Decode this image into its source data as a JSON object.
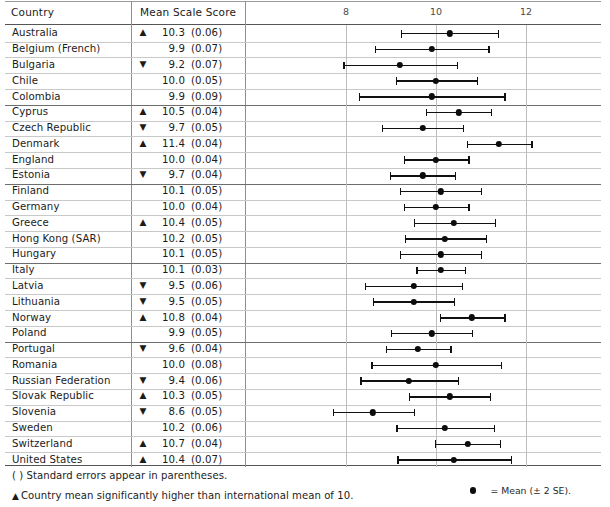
{
  "table": {
    "columns": {
      "country": "Country",
      "score": "Mean Scale Score"
    }
  },
  "footnotes": {
    "parentheses_note": "( ) Standard errors appear in parentheses.",
    "up_triangle_note": "Country mean significantly higher than international mean of 10.",
    "up_triangle_glyph": "▲"
  },
  "legend": {
    "dot_label": "= Mean (± 2 SE).",
    "dot_icon": "filled-circle"
  },
  "chart_data": {
    "type": "scatter",
    "title": "",
    "xlabel": "",
    "ylabel": "",
    "xlim": [
      6.9,
      13.3
    ],
    "ticks": [
      8,
      10,
      12
    ],
    "tick_labels": [
      "8",
      "10",
      "12"
    ],
    "grid": true,
    "error_bars": "mean plus/minus 2 SE",
    "reference_mean": 10,
    "markers": {
      "up": "▲",
      "down": "▼",
      "none": ""
    },
    "group_breaks": [
      5,
      10,
      15,
      20
    ],
    "rows": [
      {
        "country": "Australia",
        "mean": 10.3,
        "se": 0.06,
        "sig": "up",
        "mean_text": "10.3",
        "se_text": "(0.06)"
      },
      {
        "country": "Belgium (French)",
        "mean": 9.9,
        "se": 0.07,
        "sig": "none",
        "mean_text": "9.9",
        "se_text": "(0.07)"
      },
      {
        "country": "Bulgaria",
        "mean": 9.2,
        "se": 0.07,
        "sig": "down",
        "mean_text": "9.2",
        "se_text": "(0.07)"
      },
      {
        "country": "Chile",
        "mean": 10.0,
        "se": 0.05,
        "sig": "none",
        "mean_text": "10.0",
        "se_text": "(0.05)"
      },
      {
        "country": "Colombia",
        "mean": 9.9,
        "se": 0.09,
        "sig": "none",
        "mean_text": "9.9",
        "se_text": "(0.09)"
      },
      {
        "country": "Cyprus",
        "mean": 10.5,
        "se": 0.04,
        "sig": "up",
        "mean_text": "10.5",
        "se_text": "(0.04)"
      },
      {
        "country": "Czech Republic",
        "mean": 9.7,
        "se": 0.05,
        "sig": "down",
        "mean_text": "9.7",
        "se_text": "(0.05)"
      },
      {
        "country": "Denmark",
        "mean": 11.4,
        "se": 0.04,
        "sig": "up",
        "mean_text": "11.4",
        "se_text": "(0.04)"
      },
      {
        "country": "England",
        "mean": 10.0,
        "se": 0.04,
        "sig": "none",
        "mean_text": "10.0",
        "se_text": "(0.04)"
      },
      {
        "country": "Estonia",
        "mean": 9.7,
        "se": 0.04,
        "sig": "down",
        "mean_text": "9.7",
        "se_text": "(0.04)"
      },
      {
        "country": "Finland",
        "mean": 10.1,
        "se": 0.05,
        "sig": "none",
        "mean_text": "10.1",
        "se_text": "(0.05)"
      },
      {
        "country": "Germany",
        "mean": 10.0,
        "se": 0.04,
        "sig": "none",
        "mean_text": "10.0",
        "se_text": "(0.04)"
      },
      {
        "country": "Greece",
        "mean": 10.4,
        "se": 0.05,
        "sig": "up",
        "mean_text": "10.4",
        "se_text": "(0.05)"
      },
      {
        "country": "Hong Kong (SAR)",
        "mean": 10.2,
        "se": 0.05,
        "sig": "none",
        "mean_text": "10.2",
        "se_text": "(0.05)"
      },
      {
        "country": "Hungary",
        "mean": 10.1,
        "se": 0.05,
        "sig": "none",
        "mean_text": "10.1",
        "se_text": "(0.05)"
      },
      {
        "country": "Italy",
        "mean": 10.1,
        "se": 0.03,
        "sig": "none",
        "mean_text": "10.1",
        "se_text": "(0.03)"
      },
      {
        "country": "Latvia",
        "mean": 9.5,
        "se": 0.06,
        "sig": "down",
        "mean_text": "9.5",
        "se_text": "(0.06)"
      },
      {
        "country": "Lithuania",
        "mean": 9.5,
        "se": 0.05,
        "sig": "down",
        "mean_text": "9.5",
        "se_text": "(0.05)"
      },
      {
        "country": "Norway",
        "mean": 10.8,
        "se": 0.04,
        "sig": "up",
        "mean_text": "10.8",
        "se_text": "(0.04)"
      },
      {
        "country": "Poland",
        "mean": 9.9,
        "se": 0.05,
        "sig": "none",
        "mean_text": "9.9",
        "se_text": "(0.05)"
      },
      {
        "country": "Portugal",
        "mean": 9.6,
        "se": 0.04,
        "sig": "down",
        "mean_text": "9.6",
        "se_text": "(0.04)"
      },
      {
        "country": "Romania",
        "mean": 10.0,
        "se": 0.08,
        "sig": "none",
        "mean_text": "10.0",
        "se_text": "(0.08)"
      },
      {
        "country": "Russian Federation",
        "mean": 9.4,
        "se": 0.06,
        "sig": "down",
        "mean_text": "9.4",
        "se_text": "(0.06)"
      },
      {
        "country": "Slovak Republic",
        "mean": 10.3,
        "se": 0.05,
        "sig": "up",
        "mean_text": "10.3",
        "se_text": "(0.05)"
      },
      {
        "country": "Slovenia",
        "mean": 8.6,
        "se": 0.05,
        "sig": "down",
        "mean_text": "8.6",
        "se_text": "(0.05)"
      },
      {
        "country": "Sweden",
        "mean": 10.2,
        "se": 0.06,
        "sig": "none",
        "mean_text": "10.2",
        "se_text": "(0.06)"
      },
      {
        "country": "Switzerland",
        "mean": 10.7,
        "se": 0.04,
        "sig": "up",
        "mean_text": "10.7",
        "se_text": "(0.04)"
      },
      {
        "country": "United States",
        "mean": 10.4,
        "se": 0.07,
        "sig": "up",
        "mean_text": "10.4",
        "se_text": "(0.07)"
      }
    ]
  }
}
